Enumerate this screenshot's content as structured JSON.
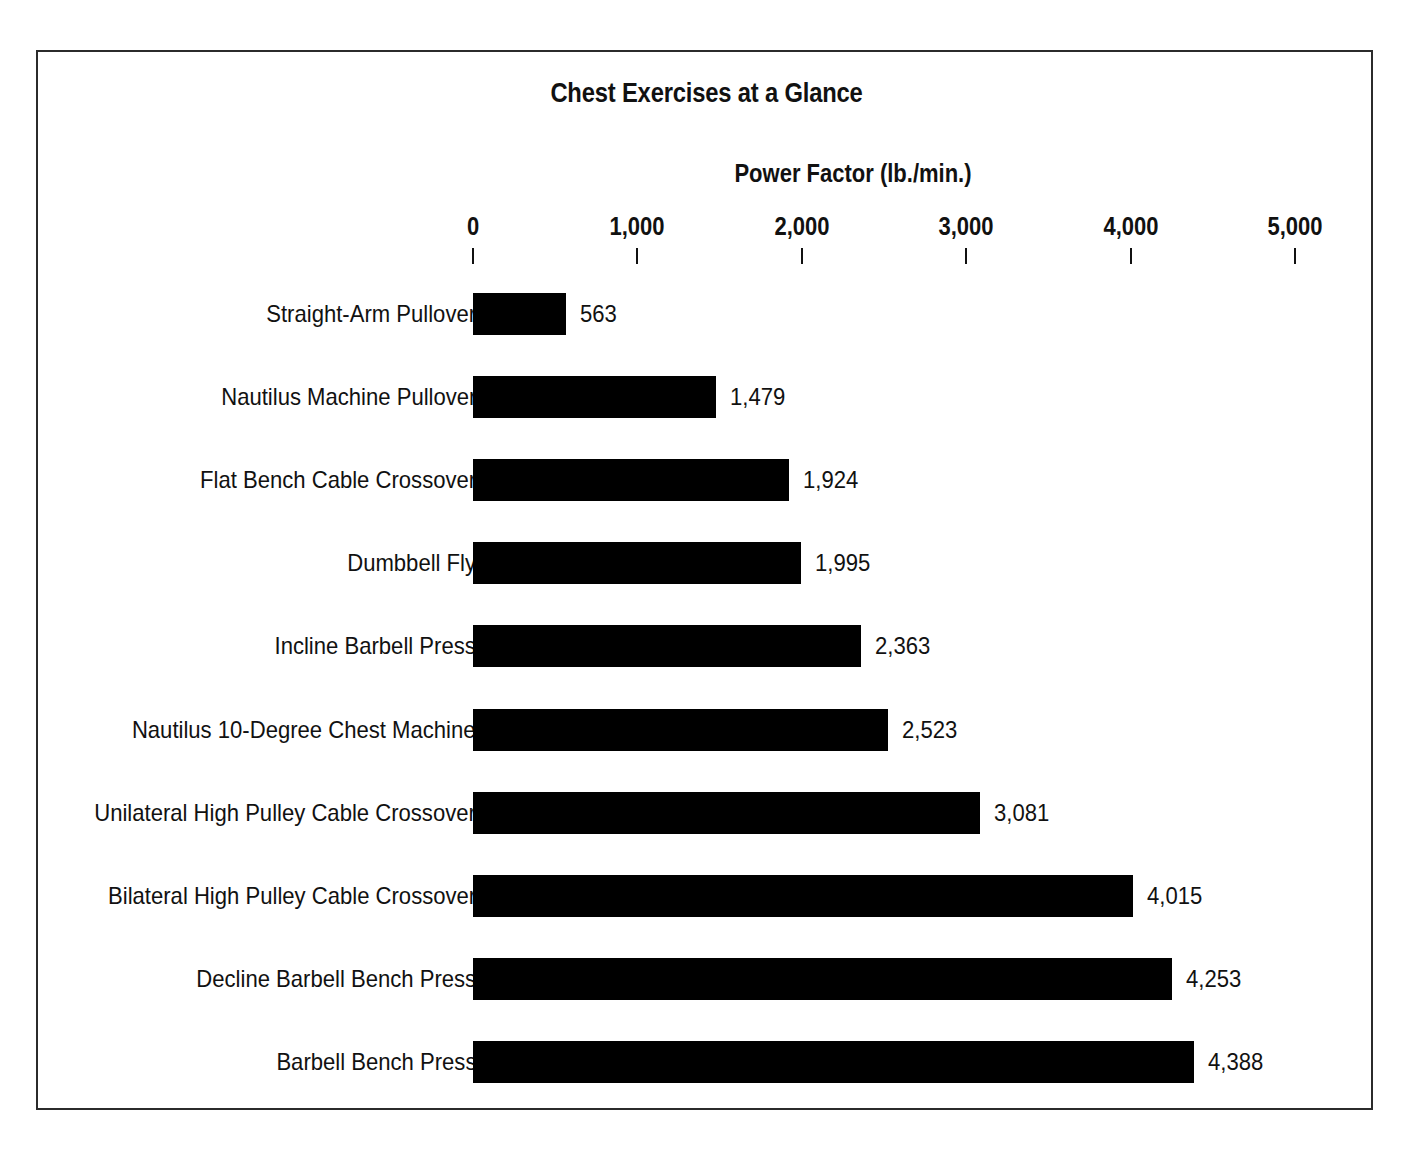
{
  "figure": {
    "title": "Chest Exercises at a Glance",
    "axis_title": "Power Factor (lb./min.)",
    "frame_color": "#2b2b2b",
    "bar_color": "#000000",
    "background": "#ffffff"
  },
  "chart_data": {
    "type": "bar",
    "orientation": "horizontal",
    "title": "Chest Exercises at a Glance",
    "xlabel": "Power Factor (lb./min.)",
    "ylabel": "",
    "xlim": [
      0,
      5000
    ],
    "grid": false,
    "legend": false,
    "xticks": [
      0,
      1000,
      2000,
      3000,
      4000,
      5000
    ],
    "xtick_labels": [
      "0",
      "1,000",
      "2,000",
      "3,000",
      "4,000",
      "5,000"
    ],
    "categories": [
      "Straight-Arm Pullover",
      "Nautilus Machine Pullover",
      "Flat Bench Cable Crossover",
      "Dumbbell Fly",
      "Incline Barbell Press",
      "Nautilus 10-Degree Chest Machine",
      "Unilateral High Pulley Cable Crossover",
      "Bilateral High Pulley Cable Crossover",
      "Decline Barbell Bench Press",
      "Barbell Bench Press"
    ],
    "values": [
      563,
      1479,
      1924,
      1995,
      2363,
      2523,
      3081,
      4015,
      4253,
      4388
    ],
    "value_labels": [
      "563",
      "1,479",
      "1,924",
      "1,995",
      "2,363",
      "2,523",
      "3,081",
      "4,015",
      "4,253",
      "4,388"
    ]
  }
}
